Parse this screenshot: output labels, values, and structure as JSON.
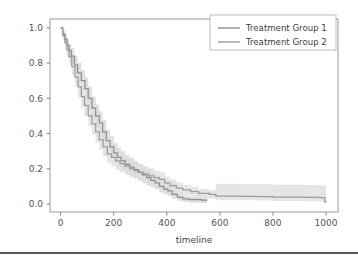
{
  "figure": {
    "background_color": "#ffffff",
    "plot_border_color": "#9a9a9a",
    "tick_color": "#777777",
    "page_rule_color": "#595959"
  },
  "chart_data": {
    "type": "line",
    "title": "",
    "subtitle": "",
    "xlabel": "timeline",
    "ylabel": "",
    "xlim": [
      -40,
      1045
    ],
    "ylim": [
      -0.045,
      1.05
    ],
    "xticks": [
      0,
      200,
      400,
      600,
      800,
      1000
    ],
    "xtick_labels": [
      "0",
      "200",
      "400",
      "600",
      "800",
      "1000"
    ],
    "yticks": [
      0.0,
      0.2,
      0.4,
      0.6,
      0.8,
      1.0
    ],
    "ytick_labels": [
      "0.0",
      "0.2",
      "0.4",
      "0.6",
      "0.8",
      "1.0"
    ],
    "grid": false,
    "legend_position": "upper right",
    "step_style": "post",
    "series": [
      {
        "name": "Treatment Group 1",
        "color": "#8f8f8f",
        "band_color": "#d4d4d4",
        "band_opacity": 0.75,
        "x": [
          0,
          8,
          16,
          24,
          32,
          40,
          52,
          64,
          78,
          92,
          104,
          118,
          132,
          146,
          158,
          172,
          186,
          200,
          214,
          228,
          244,
          260,
          276,
          292,
          308,
          324,
          340,
          356,
          372,
          388,
          404,
          420,
          440,
          460,
          485,
          510,
          530,
          552
        ],
        "y": [
          1.0,
          0.965,
          0.935,
          0.9,
          0.87,
          0.84,
          0.79,
          0.745,
          0.7,
          0.655,
          0.6,
          0.545,
          0.5,
          0.46,
          0.41,
          0.36,
          0.325,
          0.29,
          0.265,
          0.245,
          0.225,
          0.21,
          0.195,
          0.18,
          0.165,
          0.15,
          0.135,
          0.12,
          0.1,
          0.085,
          0.075,
          0.055,
          0.04,
          0.03,
          0.025,
          0.025,
          0.022,
          0.02
        ],
        "y_lower": [
          1.0,
          0.945,
          0.905,
          0.865,
          0.83,
          0.795,
          0.74,
          0.69,
          0.64,
          0.59,
          0.535,
          0.48,
          0.435,
          0.395,
          0.345,
          0.3,
          0.265,
          0.235,
          0.21,
          0.19,
          0.172,
          0.158,
          0.145,
          0.132,
          0.119,
          0.106,
          0.094,
          0.082,
          0.066,
          0.054,
          0.046,
          0.03,
          0.019,
          0.012,
          0.008,
          0.008,
          0.006,
          0.005
        ],
        "y_upper": [
          1.0,
          0.985,
          0.965,
          0.935,
          0.91,
          0.885,
          0.84,
          0.8,
          0.76,
          0.72,
          0.665,
          0.61,
          0.565,
          0.525,
          0.475,
          0.42,
          0.385,
          0.345,
          0.32,
          0.3,
          0.278,
          0.262,
          0.245,
          0.228,
          0.211,
          0.194,
          0.176,
          0.158,
          0.134,
          0.116,
          0.104,
          0.08,
          0.061,
          0.048,
          0.042,
          0.042,
          0.038,
          0.035
        ]
      },
      {
        "name": "Treatment Group 2",
        "color": "#9c9c9c",
        "band_color": "#dcdcdc",
        "band_opacity": 0.75,
        "x": [
          0,
          8,
          16,
          24,
          32,
          42,
          54,
          66,
          78,
          90,
          104,
          118,
          132,
          146,
          160,
          176,
          192,
          208,
          224,
          242,
          260,
          278,
          296,
          314,
          332,
          352,
          372,
          392,
          412,
          436,
          460,
          490,
          520,
          560,
          585,
          620,
          680,
          740,
          800,
          860,
          920,
          975,
          995,
          1000
        ],
        "y": [
          1.0,
          0.955,
          0.915,
          0.875,
          0.835,
          0.78,
          0.72,
          0.665,
          0.61,
          0.56,
          0.5,
          0.455,
          0.41,
          0.365,
          0.325,
          0.285,
          0.265,
          0.245,
          0.23,
          0.215,
          0.2,
          0.19,
          0.18,
          0.17,
          0.16,
          0.15,
          0.14,
          0.12,
          0.105,
          0.09,
          0.08,
          0.07,
          0.06,
          0.055,
          0.045,
          0.045,
          0.043,
          0.042,
          0.04,
          0.04,
          0.038,
          0.036,
          0.012,
          0.01
        ],
        "y_lower": [
          1.0,
          0.93,
          0.88,
          0.835,
          0.79,
          0.73,
          0.665,
          0.605,
          0.55,
          0.5,
          0.44,
          0.395,
          0.35,
          0.308,
          0.27,
          0.232,
          0.213,
          0.195,
          0.181,
          0.167,
          0.154,
          0.145,
          0.136,
          0.127,
          0.118,
          0.109,
          0.1,
          0.083,
          0.07,
          0.058,
          0.05,
          0.042,
          0.034,
          0.03,
          0.022,
          0.022,
          0.021,
          0.02,
          0.018,
          0.018,
          0.016,
          0.015,
          0.002,
          0.001
        ],
        "y_upper": [
          1.0,
          0.98,
          0.95,
          0.915,
          0.88,
          0.83,
          0.775,
          0.725,
          0.67,
          0.62,
          0.56,
          0.515,
          0.47,
          0.422,
          0.38,
          0.338,
          0.317,
          0.295,
          0.279,
          0.263,
          0.246,
          0.235,
          0.224,
          0.213,
          0.202,
          0.191,
          0.18,
          0.157,
          0.14,
          0.122,
          0.11,
          0.098,
          0.086,
          0.08,
          0.115,
          0.115,
          0.113,
          0.112,
          0.11,
          0.11,
          0.108,
          0.106,
          0.105,
          0.105
        ]
      }
    ],
    "legend_entries": [
      {
        "label": "Treatment Group 1",
        "color": "#8f8f8f"
      },
      {
        "label": "Treatment Group 2",
        "color": "#9c9c9c"
      }
    ]
  }
}
